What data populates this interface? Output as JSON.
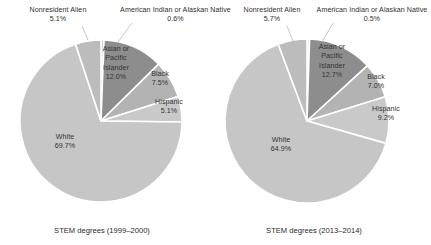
{
  "figure": {
    "background": "#ffffff",
    "label_color": "#2f2f2f",
    "leader_line_color": "#b8b8b8",
    "slice_border_color": "#ffffff"
  },
  "chart_data": [
    {
      "type": "pie",
      "title": "STEM degrees (1999–2000)",
      "caption": "STEM degrees (1999–2000)",
      "legend": "none",
      "start_angle_deg": 0,
      "direction": "clockwise",
      "categories": [
        "American Indian or Alaskan Native",
        "Asian or Pacific Islander",
        "Black",
        "Hispanic",
        "White",
        "Nonresident Alien"
      ],
      "values": [
        0.6,
        12.0,
        7.5,
        5.1,
        69.7,
        5.1
      ],
      "units": "percent",
      "slices": [
        {
          "label": "American Indian or Alaskan Native",
          "value": 0.6,
          "value_text": "0.6%",
          "color": "#cfcfcf",
          "label_placement": "outside-top"
        },
        {
          "label": "Asian or Pacific Islander",
          "value": 12.0,
          "value_text": "12.0%",
          "color": "#8d8d8d",
          "label_placement": "inside"
        },
        {
          "label": "Black",
          "value": 7.5,
          "value_text": "7.5%",
          "color": "#b3b3b3",
          "label_placement": "inside"
        },
        {
          "label": "Hispanic",
          "value": 5.1,
          "value_text": "5.1%",
          "color": "#c9c9c9",
          "label_placement": "inside"
        },
        {
          "label": "White",
          "value": 69.7,
          "value_text": "69.7%",
          "color": "#c6c6c6",
          "label_placement": "inside"
        },
        {
          "label": "Nonresident Alien",
          "value": 5.1,
          "value_text": "5.1%",
          "color": "#bcbcbc",
          "label_placement": "outside-top-left"
        }
      ]
    },
    {
      "type": "pie",
      "title": "STEM degrees (2013–2014)",
      "caption": "STEM degrees (2013–2014)",
      "legend": "none",
      "start_angle_deg": 0,
      "direction": "clockwise",
      "categories": [
        "American Indian or Alaskan Native",
        "Asian or Pacific Islander",
        "Black",
        "Hispanic",
        "White",
        "Nonresident Alien"
      ],
      "values": [
        0.5,
        12.7,
        7.0,
        9.2,
        64.9,
        5.7
      ],
      "units": "percent",
      "slices": [
        {
          "label": "American Indian or Alaskan Native",
          "value": 0.5,
          "value_text": "0.5%",
          "color": "#cfcfcf",
          "label_placement": "outside-top"
        },
        {
          "label": "Asian or Pacific Islander",
          "value": 12.7,
          "value_text": "12.7%",
          "color": "#8d8d8d",
          "label_placement": "inside"
        },
        {
          "label": "Black",
          "value": 7.0,
          "value_text": "7.0%",
          "color": "#b3b3b3",
          "label_placement": "inside"
        },
        {
          "label": "Hispanic",
          "value": 9.2,
          "value_text": "9.2%",
          "color": "#c9c9c9",
          "label_placement": "inside"
        },
        {
          "label": "White",
          "value": 64.9,
          "value_text": "64.9%",
          "color": "#c6c6c6",
          "label_placement": "inside"
        },
        {
          "label": "Nonresident Alien",
          "value": 5.7,
          "value_text": "5.7%",
          "color": "#bcbcbc",
          "label_placement": "outside-top-left"
        }
      ]
    }
  ],
  "left_chart": {
    "caption": "STEM degrees (1999–2000)",
    "labels": {
      "nonresident_alien_name": "Nonresident Alien",
      "nonresident_alien_pct": "5.1%",
      "american_indian_name": "American Indian or Alaskan Native",
      "american_indian_pct": "0.6%",
      "asian_name_l1": "Asian or",
      "asian_name_l2": "Pacific",
      "asian_name_l3": "Islander",
      "asian_pct": "12.0%",
      "black_name": "Black",
      "black_pct": "7.5%",
      "hispanic_name": "Hispanic",
      "hispanic_pct": "5.1%",
      "white_name": "White",
      "white_pct": "69.7%"
    }
  },
  "right_chart": {
    "caption": "STEM degrees (2013–2014)",
    "labels": {
      "nonresident_alien_name": "Nonresident Alien",
      "nonresident_alien_pct": "5.7%",
      "american_indian_name": "American Indian or Alaskan Native",
      "american_indian_pct": "0.5%",
      "asian_name_l1": "Asian or",
      "asian_name_l2": "Pacific",
      "asian_name_l3": "Islander",
      "asian_pct": "12.7%",
      "black_name": "Black",
      "black_pct": "7.0%",
      "hispanic_name": "Hispanic",
      "hispanic_pct": "9.2%",
      "white_name": "White",
      "white_pct": "64.9%"
    }
  }
}
